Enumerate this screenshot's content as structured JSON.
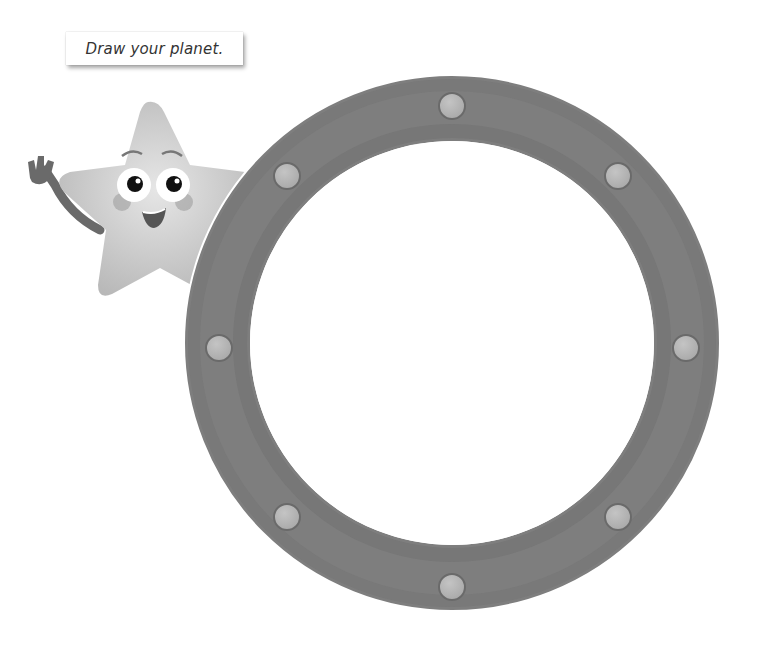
{
  "instruction": {
    "text": "Draw your planet."
  },
  "character": {
    "name": "star-mascot"
  },
  "porthole": {
    "center": [
      452,
      343
    ],
    "outer_radius": 267,
    "inner_radius": 202,
    "bolt_radius": 235,
    "bolt_count": 8,
    "colors": {
      "ring": "#7e7e7e",
      "ring_dark": "#6c6c6c",
      "bolt": "#b4b4b4",
      "window": "#ffffff"
    }
  }
}
